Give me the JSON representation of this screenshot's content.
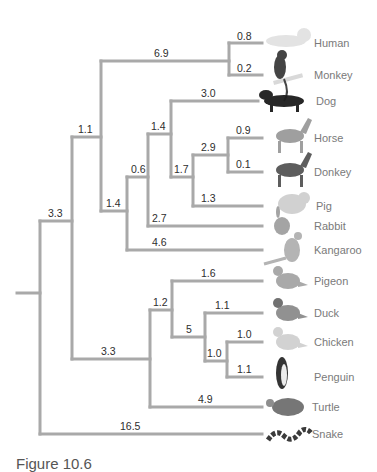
{
  "figure": {
    "caption": "Figure 10.6",
    "branch_color": "#a9a9a9",
    "label_color": "#2e2e2e",
    "taxon_color": "#7a7a7a"
  },
  "taxa": [
    {
      "name": "Human",
      "y": 43,
      "tip_x": 262,
      "label_x": 314,
      "icon": "human-icon",
      "icon_color": "#e2e2e2"
    },
    {
      "name": "Monkey",
      "y": 75,
      "tip_x": 262,
      "label_x": 314,
      "icon": "monkey-icon",
      "icon_color": "#3a3a3a"
    },
    {
      "name": "Dog",
      "y": 101,
      "tip_x": 258,
      "label_x": 316,
      "icon": "dog-icon",
      "icon_color": "#1c1c1c"
    },
    {
      "name": "Horse",
      "y": 138,
      "tip_x": 262,
      "label_x": 314,
      "icon": "horse-icon",
      "icon_color": "#9a9a9a"
    },
    {
      "name": "Donkey",
      "y": 172,
      "tip_x": 262,
      "label_x": 314,
      "icon": "donkey-icon",
      "icon_color": "#555555"
    },
    {
      "name": "Pig",
      "y": 206,
      "tip_x": 262,
      "label_x": 316,
      "icon": "pig-icon",
      "icon_color": "#cfcfcf"
    },
    {
      "name": "Rabbit",
      "y": 226,
      "tip_x": 262,
      "label_x": 314,
      "icon": "rabbit-icon",
      "icon_color": "#a0a0a0"
    },
    {
      "name": "Kangaroo",
      "y": 250,
      "tip_x": 262,
      "label_x": 314,
      "icon": "kangaroo-icon",
      "icon_color": "#b0b0b0"
    },
    {
      "name": "Pigeon",
      "y": 281,
      "tip_x": 262,
      "label_x": 314,
      "icon": "pigeon-icon",
      "icon_color": "#a5a5a5"
    },
    {
      "name": "Duck",
      "y": 313,
      "tip_x": 262,
      "label_x": 314,
      "icon": "duck-icon",
      "icon_color": "#8c8c8c"
    },
    {
      "name": "Chicken",
      "y": 342,
      "tip_x": 262,
      "label_x": 314,
      "icon": "chicken-icon",
      "icon_color": "#d0d0d0"
    },
    {
      "name": "Penguin",
      "y": 377,
      "tip_x": 262,
      "label_x": 314,
      "icon": "penguin-icon",
      "icon_color": "#2a2a2a"
    },
    {
      "name": "Turtle",
      "y": 407,
      "tip_x": 262,
      "label_x": 312,
      "icon": "turtle-icon",
      "icon_color": "#6f6f6f"
    },
    {
      "name": "Snake",
      "y": 434,
      "tip_x": 262,
      "label_x": 312,
      "icon": "snake-icon",
      "icon_color": "#303030"
    }
  ],
  "branches": [
    {
      "label": "0.8",
      "x1": 229,
      "x2": 262,
      "y": 43,
      "lx": 237,
      "ly": 40
    },
    {
      "label": "0.2",
      "x1": 229,
      "x2": 262,
      "y": 75,
      "lx": 237,
      "ly": 72
    },
    {
      "label": "6.9",
      "x1": 101,
      "x2": 229,
      "y": 61,
      "lx": 154,
      "ly": 57
    },
    {
      "label": "3.0",
      "x1": 171,
      "x2": 258,
      "y": 101,
      "lx": 201,
      "ly": 97
    },
    {
      "label": "0.9",
      "x1": 228,
      "x2": 262,
      "y": 138,
      "lx": 236,
      "ly": 134
    },
    {
      "label": "0.1",
      "x1": 228,
      "x2": 262,
      "y": 172,
      "lx": 236,
      "ly": 168
    },
    {
      "label": "2.9",
      "x1": 193,
      "x2": 228,
      "y": 155,
      "lx": 201,
      "ly": 151
    },
    {
      "label": "1.3",
      "x1": 193,
      "x2": 262,
      "y": 206,
      "lx": 201,
      "ly": 202
    },
    {
      "label": "1.7",
      "x1": 171,
      "x2": 193,
      "y": 177,
      "lx": 174,
      "ly": 173
    },
    {
      "label": "1.4",
      "x1": 148,
      "x2": 171,
      "y": 134,
      "lx": 151,
      "ly": 130
    },
    {
      "label": "2.7",
      "x1": 148,
      "x2": 262,
      "y": 226,
      "lx": 152,
      "ly": 222
    },
    {
      "label": "0.6",
      "x1": 127,
      "x2": 148,
      "y": 177,
      "lx": 131,
      "ly": 173
    },
    {
      "label": "4.6",
      "x1": 127,
      "x2": 262,
      "y": 250,
      "lx": 152,
      "ly": 246
    },
    {
      "label": "1.4",
      "x1": 101,
      "x2": 127,
      "y": 211,
      "lx": 106,
      "ly": 207
    },
    {
      "label": "1.1",
      "x1": 72,
      "x2": 101,
      "y": 137,
      "lx": 78,
      "ly": 133
    },
    {
      "label": "1.6",
      "x1": 172,
      "x2": 262,
      "y": 281,
      "lx": 201,
      "ly": 277
    },
    {
      "label": "1.1",
      "x1": 205,
      "x2": 262,
      "y": 313,
      "lx": 215,
      "ly": 309
    },
    {
      "label": "1.0",
      "x1": 227,
      "x2": 262,
      "y": 342,
      "lx": 237,
      "ly": 338
    },
    {
      "label": "1.1",
      "x1": 227,
      "x2": 262,
      "y": 377,
      "lx": 237,
      "ly": 373
    },
    {
      "label": "1.0",
      "x1": 205,
      "x2": 227,
      "y": 361,
      "lx": 207,
      "ly": 357
    },
    {
      "label": "5",
      "x1": 172,
      "x2": 205,
      "y": 337,
      "lx": 186,
      "ly": 333
    },
    {
      "label": "1.2",
      "x1": 150,
      "x2": 172,
      "y": 310,
      "lx": 153,
      "ly": 306
    },
    {
      "label": "4.9",
      "x1": 150,
      "x2": 262,
      "y": 407,
      "lx": 198,
      "ly": 403
    },
    {
      "label": "3.3",
      "x1": 72,
      "x2": 150,
      "y": 359,
      "lx": 101,
      "ly": 355
    },
    {
      "label": "3.3",
      "x1": 40,
      "x2": 72,
      "y": 221,
      "lx": 48,
      "ly": 217
    },
    {
      "label": "16.5",
      "x1": 40,
      "x2": 262,
      "y": 434,
      "lx": 120,
      "ly": 430
    },
    {
      "label": "",
      "x1": 17,
      "x2": 40,
      "y": 293,
      "lx": 0,
      "ly": 0
    }
  ],
  "verticals": [
    {
      "x": 229,
      "y1": 43,
      "y2": 75
    },
    {
      "x": 228,
      "y1": 138,
      "y2": 172
    },
    {
      "x": 193,
      "y1": 155,
      "y2": 206
    },
    {
      "x": 171,
      "y1": 101,
      "y2": 177
    },
    {
      "x": 148,
      "y1": 134,
      "y2": 226
    },
    {
      "x": 127,
      "y1": 177,
      "y2": 250
    },
    {
      "x": 101,
      "y1": 61,
      "y2": 211
    },
    {
      "x": 227,
      "y1": 342,
      "y2": 377
    },
    {
      "x": 205,
      "y1": 313,
      "y2": 361
    },
    {
      "x": 172,
      "y1": 281,
      "y2": 337
    },
    {
      "x": 150,
      "y1": 310,
      "y2": 407
    },
    {
      "x": 72,
      "y1": 137,
      "y2": 359
    },
    {
      "x": 40,
      "y1": 221,
      "y2": 434
    }
  ]
}
